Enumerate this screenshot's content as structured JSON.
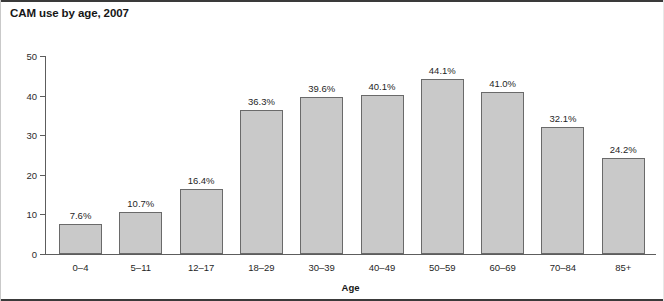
{
  "chart_data": {
    "type": "bar",
    "title": "CAM use by age, 2007",
    "xlabel": "Age",
    "ylabel": "",
    "categories": [
      "0–4",
      "5–11",
      "12–17",
      "18–29",
      "30–39",
      "40–49",
      "50–59",
      "60–69",
      "70–84",
      "85+"
    ],
    "values": [
      7.6,
      10.7,
      16.4,
      36.3,
      39.6,
      40.1,
      44.1,
      41.0,
      32.1,
      24.2
    ],
    "value_labels": [
      "7.6%",
      "10.7%",
      "16.4%",
      "36.3%",
      "39.6%",
      "40.1%",
      "44.1%",
      "41.0%",
      "32.1%",
      "24.2%"
    ],
    "ylim": [
      0,
      50
    ],
    "yticks": [
      0,
      10,
      20,
      30,
      40,
      50
    ],
    "ytick_labels": [
      "0",
      "10",
      "20",
      "30",
      "40",
      "50"
    ],
    "grid": false,
    "legend": null,
    "colors": {
      "bar_fill": "#c9c9c9",
      "bar_border": "#6a6a6a",
      "axis": "#5d5d5d",
      "text": "#1f1f1f",
      "title": "#161616",
      "frame": "#3a3a3a"
    }
  }
}
